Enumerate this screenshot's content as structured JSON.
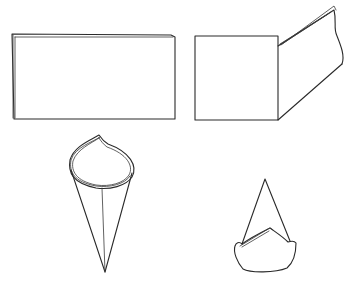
{
  "diagram": {
    "figures": [
      {
        "id": "step-1",
        "description": "flat folded rectangle"
      },
      {
        "id": "step-2",
        "description": "rectangle with one side folded back at an angle"
      },
      {
        "id": "step-3",
        "description": "rolled cone with curled rim"
      },
      {
        "id": "step-4",
        "description": "standing cone with folded cuff base"
      }
    ],
    "colors": {
      "line": "#2a2a2a",
      "background": "#ffffff"
    }
  }
}
